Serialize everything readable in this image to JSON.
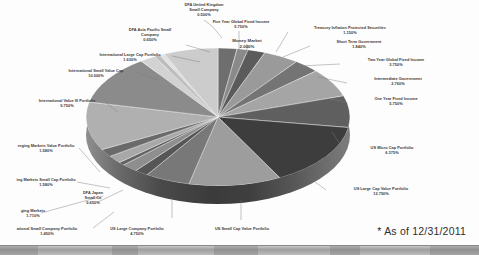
{
  "footnote": "* As of 12/31/2011",
  "chart_data": {
    "type": "pie",
    "title": "",
    "subtitle": "",
    "xlabel": "",
    "ylabel": "",
    "legend_position": "none",
    "grid": false,
    "value_unit": "%",
    "three_d": true,
    "categories": [
      "Money Market",
      "Treasury Inflation Protected Securities",
      "Short Term Government",
      "Two Year Global Fixed Income",
      "Intermediate Government",
      "One Year Fixed Income",
      "US Micro Cap Portfolio",
      "US Large Cap Value Portfolio",
      "US Small Cap Value Portfolio",
      "US Large Company Portfolio",
      "International Small Company Portfolio",
      "Emerging Markets",
      "DFA Japan Small Co",
      "Emerging Markets Small Cap Portfolio",
      "Emerging Markets Value Portfolio",
      "International Value III Portfolio",
      "International Small Value Cap",
      "International Large Cap Portfolio",
      "DFA Asia Pacific Small Company",
      "DFA United Kingdom Small Company",
      "Five Year Global Fixed Income"
    ],
    "values": [
      2.0,
      1.15,
      1.84,
      3.75,
      2.76,
      5.75,
      6.375,
      12.75,
      9.75,
      4.75,
      1.45,
      1.71,
      0.65,
      1.58,
      1.58,
      9.75,
      10.0,
      1.63,
      0.65,
      0.5,
      5.75
    ],
    "slices": [
      {
        "label": "Money Market",
        "value": 2.0,
        "display": "2.000%",
        "color": "#6e6e6e"
      },
      {
        "label": "Treasury Inflation Protected Securities",
        "value": 1.15,
        "display": "1.150%",
        "color": "#8a8a8a"
      },
      {
        "label": "Short Term Government",
        "value": 1.84,
        "display": "1.840%",
        "color": "#5b5b5b"
      },
      {
        "label": "Two Year Global Fixed Income",
        "value": 3.75,
        "display": "3.750%",
        "color": "#9a9a9a"
      },
      {
        "label": "Intermediate Government",
        "value": 2.76,
        "display": "2.760%",
        "color": "#747474"
      },
      {
        "label": "One Year Fixed Income",
        "value": 5.75,
        "display": "5.750%",
        "color": "#a5a5a5"
      },
      {
        "label": "US Micro Cap Portfolio",
        "value": 6.375,
        "display": "6.375%",
        "color": "#5f5f5f"
      },
      {
        "label": "US Large Cap Value Portfolio",
        "value": 12.75,
        "display": "12.750%",
        "color": "#3d3d3d"
      },
      {
        "label": "US Small Cap Value Portfolio",
        "value": 9.75,
        "display": "9.750%",
        "color": "#9d9d9d"
      },
      {
        "label": "US Large Company Portfolio",
        "value": 4.75,
        "display": "4.750%",
        "color": "#787878"
      },
      {
        "label": "International Small Company Portfolio",
        "value": 1.45,
        "display": "1.450%",
        "color": "#565656"
      },
      {
        "label": "Emerging Markets",
        "value": 1.71,
        "display": "1.710%",
        "color": "#8e8e8e"
      },
      {
        "label": "DFA Japan Small Co",
        "value": 0.65,
        "display": "0.650%",
        "color": "#616161"
      },
      {
        "label": "Emerging Markets Small Cap Portfolio",
        "value": 1.58,
        "display": "1.580%",
        "color": "#a8a8a8"
      },
      {
        "label": "Emerging Markets Value Portfolio",
        "value": 1.58,
        "display": "1.580%",
        "color": "#6a6a6a"
      },
      {
        "label": "International Value III Portfolio",
        "value": 9.75,
        "display": "9.750%",
        "color": "#b0b0b0"
      },
      {
        "label": "International Small Value Cap",
        "value": 10.0,
        "display": "10.000%",
        "color": "#8b8b8b"
      },
      {
        "label": "International Large Cap Portfolio",
        "value": 1.63,
        "display": "1.630%",
        "color": "#d2d2d2"
      },
      {
        "label": "DFA Asia Pacific Small Company",
        "value": 0.65,
        "display": "0.650%",
        "color": "#bdbdbd"
      },
      {
        "label": "DFA United Kingdom Small Company",
        "value": 0.5,
        "display": "0.500%",
        "color": "#e0e0e0"
      },
      {
        "label": "Five Year Global Fixed Income",
        "value": 5.75,
        "display": "5.750%",
        "color": "#cccccc"
      }
    ]
  },
  "labels": {
    "dfa_uk_small_company": {
      "name_line1": "DFA United Kingdom",
      "name_line2": "Small Company",
      "pct": "0.500%"
    },
    "five_year_global_fixed": {
      "name": "Five Year Global Fixed Income",
      "pct": "5.750%"
    },
    "dfa_asia_pacific_small": {
      "name_line1": "DFA Asia Pacific Small",
      "name_line2": "Company",
      "pct": "0.650%"
    },
    "money_market": {
      "name": "Money Market",
      "pct": "2.000%"
    },
    "treasury_inflation": {
      "name": "Treasury Inflation Protected Securities",
      "pct": "1.150%"
    },
    "short_term_government": {
      "name": "Short Term Government",
      "pct": "1.840%"
    },
    "two_year_global_fixed": {
      "name": "Two Year Global Fixed Income",
      "pct": "3.750%"
    },
    "intermediate_government": {
      "name": "Intermediate Government",
      "pct": "2.760%"
    },
    "one_year_fixed_income": {
      "name": "One Year Fixed Income",
      "pct": "5.750%"
    },
    "us_micro_cap": {
      "name": "US Micro Cap Portfolio",
      "pct": "6.375%"
    },
    "us_large_cap_value": {
      "name": "US Large Cap Value Portfolio",
      "pct": "12.750%"
    },
    "us_small_cap_value": {
      "name": "US Small Cap Value Portfolio",
      "pct": ""
    },
    "us_large_company": {
      "name": "US Large Company Portfolio",
      "pct": "4.750%"
    },
    "intl_small_company": {
      "name": "ational Small Company Portfolio",
      "pct": "1.450%"
    },
    "emerging_markets": {
      "name": "ging Markets",
      "pct": "1.710%"
    },
    "dfa_japan_small_co": {
      "name_line1": "DFA Japan",
      "name_line2": "Small Co",
      "pct": "0.650%"
    },
    "emerging_markets_small_cap": {
      "name": "ing Markets Small Cap Portfolio",
      "pct": "1.580%"
    },
    "emerging_markets_value": {
      "name": "erging Markets Value Portfolio",
      "pct": "1.580%"
    },
    "intl_value_iii": {
      "name": "International Value III Portfolio",
      "pct": "9.750%"
    },
    "intl_small_value_cap": {
      "name": "International Small Value Cap",
      "pct": "10.000%"
    },
    "intl_large_cap": {
      "name": "International Large Cap Portfolio",
      "pct": "1.630%"
    }
  }
}
